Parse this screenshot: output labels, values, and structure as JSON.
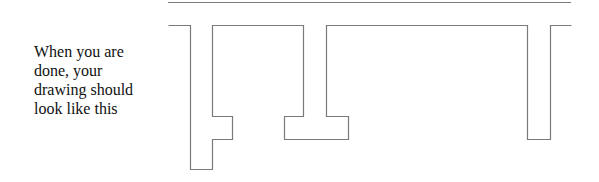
{
  "caption": {
    "lines": [
      "When you are",
      "done, your",
      "drawing should",
      "look like this"
    ]
  },
  "drawing": {
    "stroke_color": "#7a7a7a",
    "top_rule": {
      "x1": 168,
      "x2": 571,
      "y": 2
    },
    "outline_points": "168,25 190,25 190,169 212,169 212,139 232,139 232,116 212,116 212,25 303,25 303,116 284,116 284,139 348,139 348,116 326,116 326,25 527,25 527,139 550,139 550,25 571,25"
  }
}
